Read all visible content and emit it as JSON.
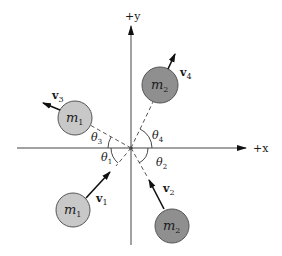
{
  "figure": {
    "type": "collision-diagram",
    "colors": {
      "background": "#ffffff",
      "axis": "#333333",
      "m1_fill": "#c8c8c8",
      "m2_fill": "#8f8f8f",
      "circle_stroke": "#555555",
      "arrow": "#111111",
      "dashed": "#444444"
    }
  },
  "axes": {
    "x_label": "+x",
    "y_label": "+y"
  },
  "bodies": [
    {
      "id": "m1-before",
      "label": "m",
      "sub": "1",
      "velocity": "v",
      "velocity_sub": "1",
      "angle": "θ",
      "angle_sub": "1",
      "position": "lower-left"
    },
    {
      "id": "m2-before",
      "label": "m",
      "sub": "2",
      "velocity": "v",
      "velocity_sub": "2",
      "angle": "θ",
      "angle_sub": "2",
      "position": "lower-right"
    },
    {
      "id": "m1-after",
      "label": "m",
      "sub": "1",
      "velocity": "v",
      "velocity_sub": "3",
      "angle": "θ",
      "angle_sub": "3",
      "position": "upper-left"
    },
    {
      "id": "m2-after",
      "label": "m",
      "sub": "2",
      "velocity": "v",
      "velocity_sub": "4",
      "angle": "θ",
      "angle_sub": "4",
      "position": "upper-right"
    }
  ]
}
